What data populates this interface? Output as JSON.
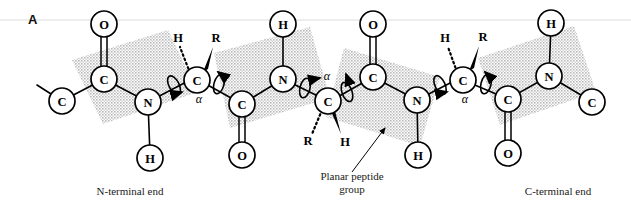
{
  "figure": {
    "panel_label": "A",
    "width": 631,
    "height": 213,
    "background_color": "#ffffff",
    "plane_fill_color": "#d2d2d2",
    "bond_color": "#000000",
    "atom_fill_color": "#ffffff"
  },
  "captions": {
    "n_terminal": "N-terminal end",
    "c_terminal": "C-terminal end",
    "planar_group": "Planar peptide\ngroup"
  },
  "atoms": {
    "term_c_left": "C",
    "o1": "O",
    "c1": "C",
    "n1": "N",
    "h1": "H",
    "ca1": "C",
    "ca1_alpha": "α",
    "ca1_h": "H",
    "ca1_r": "R",
    "h2": "H",
    "n2": "N",
    "c2": "C",
    "o2": "O",
    "ca2": "C",
    "ca2_alpha": "α",
    "ca2_r": "R",
    "ca2_h": "H",
    "o3": "O",
    "c3": "C",
    "n3": "N",
    "h3": "H",
    "ca3": "C",
    "ca3_alpha": "α",
    "ca3_h": "H",
    "ca3_r": "R",
    "h4": "H",
    "n4": "N",
    "c4": "C",
    "o4": "O",
    "term_c_right": "C"
  },
  "structure": {
    "description": "Polypeptide backbone showing four planar peptide groups connected by alpha carbons with rotatable phi and psi bonds",
    "plane_count": 4,
    "alpha_carbon_count": 3,
    "rotation_arrow_count": 6
  }
}
